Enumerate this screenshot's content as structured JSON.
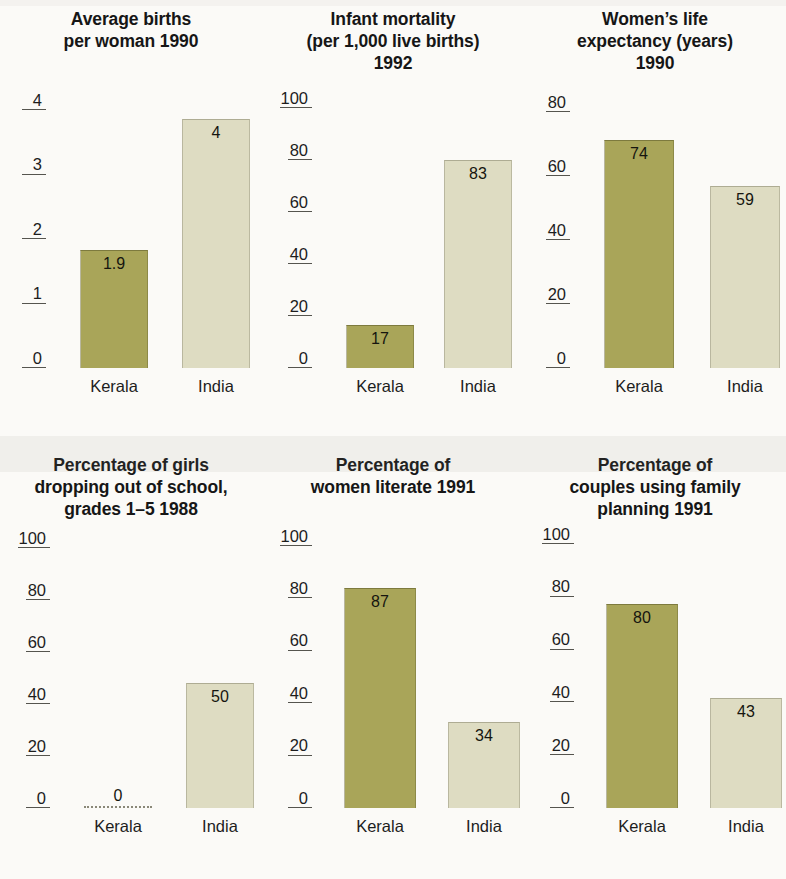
{
  "figure": {
    "categories": [
      "Kerala",
      "India"
    ],
    "colors": {
      "kerala_bar": "#a9a559",
      "india_bar": "#dedcc2",
      "background": "#fbfaf7",
      "text": "#1a1a1a",
      "axis": "#55544e"
    }
  },
  "chart_data": [
    {
      "type": "bar",
      "title": "Average births per woman 1990",
      "title_lines": [
        "Average births",
        "per woman 1990"
      ],
      "categories": [
        "Kerala",
        "India"
      ],
      "values": [
        1.9,
        4
      ],
      "value_labels": [
        "1.9",
        "4"
      ],
      "xlabel": "",
      "ylabel": "",
      "ylim": [
        0,
        4
      ],
      "yticks": [
        0,
        1,
        2,
        3,
        4
      ],
      "ytick_labels": [
        "0",
        "1",
        "2",
        "3",
        "4"
      ],
      "grid": false,
      "legend": "none"
    },
    {
      "type": "bar",
      "title": "Infant mortality (per 1,000 live births) 1992",
      "title_lines": [
        "Infant mortality",
        "(per 1,000 live births)",
        "1992"
      ],
      "categories": [
        "Kerala",
        "India"
      ],
      "values": [
        17,
        83
      ],
      "value_labels": [
        "17",
        "83"
      ],
      "xlabel": "",
      "ylabel": "",
      "ylim": [
        0,
        100
      ],
      "yticks": [
        0,
        20,
        40,
        60,
        80,
        100
      ],
      "ytick_labels": [
        "0",
        "20",
        "40",
        "60",
        "80",
        "100"
      ],
      "grid": false,
      "legend": "none"
    },
    {
      "type": "bar",
      "title": "Women’s life expectancy (years) 1990",
      "title_lines": [
        "Women’s life",
        "expectancy (years)",
        "1990"
      ],
      "categories": [
        "Kerala",
        "India"
      ],
      "values": [
        74,
        59
      ],
      "value_labels": [
        "74",
        "59"
      ],
      "xlabel": "",
      "ylabel": "",
      "ylim": [
        0,
        80
      ],
      "yticks": [
        0,
        20,
        40,
        60,
        80
      ],
      "ytick_labels": [
        "0",
        "20",
        "40",
        "60",
        "80"
      ],
      "grid": false,
      "legend": "none"
    },
    {
      "type": "bar",
      "title": "Percentage of girls dropping out of school, grades 1–5 1988",
      "title_lines": [
        "Percentage of girls",
        "dropping out of school,",
        "grades 1–5  1988"
      ],
      "categories": [
        "Kerala",
        "India"
      ],
      "values": [
        0,
        50
      ],
      "value_labels": [
        "0",
        "50"
      ],
      "xlabel": "",
      "ylabel": "",
      "ylim": [
        0,
        100
      ],
      "yticks": [
        0,
        20,
        40,
        60,
        80,
        100
      ],
      "ytick_labels": [
        "0",
        "20",
        "40",
        "60",
        "80",
        "100"
      ],
      "grid": false,
      "legend": "none"
    },
    {
      "type": "bar",
      "title": "Percentage of women literate 1991",
      "title_lines": [
        "Percentage of",
        "women literate 1991"
      ],
      "categories": [
        "Kerala",
        "India"
      ],
      "values": [
        87,
        34
      ],
      "value_labels": [
        "87",
        "34"
      ],
      "xlabel": "",
      "ylabel": "",
      "ylim": [
        0,
        100
      ],
      "yticks": [
        0,
        20,
        40,
        60,
        80,
        100
      ],
      "ytick_labels": [
        "0",
        "20",
        "40",
        "60",
        "80",
        "100"
      ],
      "grid": false,
      "legend": "none"
    },
    {
      "type": "bar",
      "title": "Percentage of couples using family planning 1991",
      "title_lines": [
        "Percentage of",
        "couples using family",
        "planning 1991"
      ],
      "categories": [
        "Kerala",
        "India"
      ],
      "values": [
        80,
        43
      ],
      "value_labels": [
        "80",
        "43"
      ],
      "xlabel": "",
      "ylabel": "",
      "ylim": [
        0,
        100
      ],
      "yticks": [
        0,
        20,
        40,
        60,
        80,
        100
      ],
      "ytick_labels": [
        "0",
        "20",
        "40",
        "60",
        "80",
        "100"
      ],
      "grid": false,
      "legend": "none"
    }
  ]
}
